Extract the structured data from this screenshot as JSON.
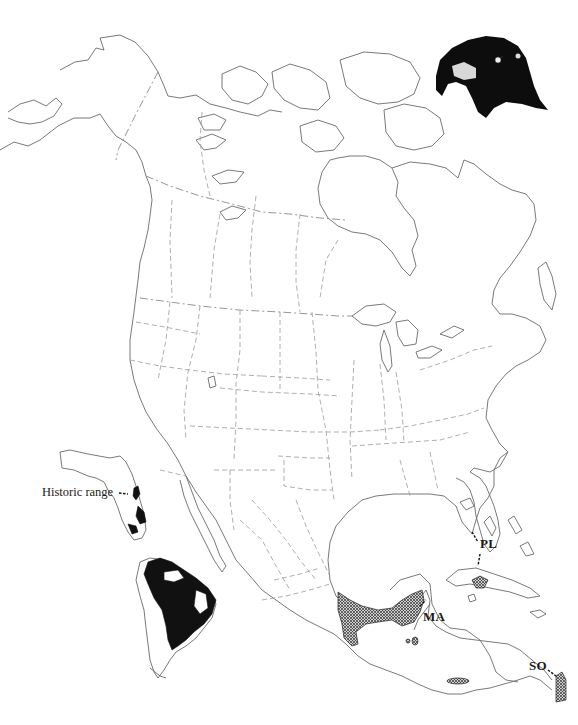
{
  "figure": {
    "type": "species-range-map",
    "region_main": "North America, Central America and Caribbean",
    "inset": "South America",
    "illustration": "falcon-head"
  },
  "labels": {
    "historic_range": "Historic range",
    "pl": "PL",
    "ma": "MA",
    "so": "SO"
  },
  "legend_styles": {
    "solid_range_color": "#111111",
    "hatched_range_color": "#555555",
    "coastline_color": "#6a6a6a",
    "border_color": "#9a9a9a",
    "background": "#ffffff"
  },
  "range_areas": [
    {
      "id": "south-america-range",
      "style": "solid"
    },
    {
      "id": "florida-historic-range",
      "style": "solid"
    },
    {
      "id": "ma-range",
      "label": "MA",
      "style": "crosshatch"
    },
    {
      "id": "pl-range",
      "label": "PL",
      "style": "crosshatch"
    },
    {
      "id": "so-range",
      "label": "SO",
      "style": "crosshatch"
    },
    {
      "id": "honduras-nicaragua-patch",
      "style": "crosshatch"
    }
  ]
}
